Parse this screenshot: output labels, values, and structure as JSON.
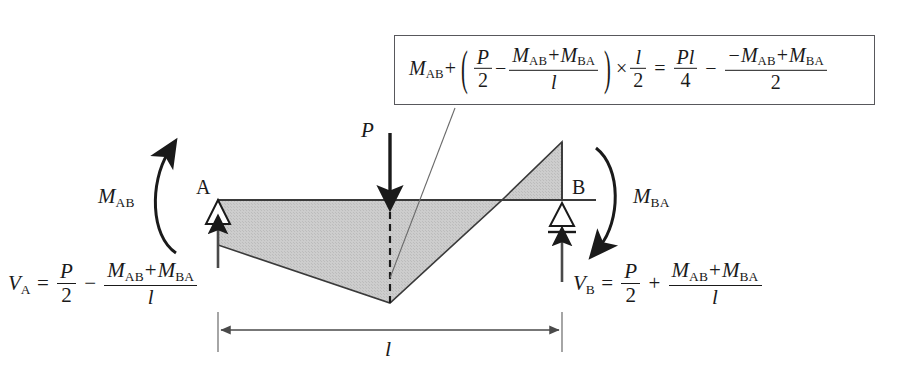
{
  "figure": {
    "background_color": "#ffffff",
    "diagram_fill_color": "#c9c9c9",
    "line_color": "#1a1a1a",
    "box_border_color": "#58585c"
  },
  "formula_box": {
    "name": "midspan-moment-equation",
    "lhs": {
      "term1": "M",
      "term1_sub": "AB",
      "plus": "+",
      "group": {
        "frac1": {
          "num": "P",
          "den": "2"
        },
        "minus": "−",
        "frac2": {
          "num": "Mₐʙ + Mʙₐ",
          "den": "l"
        }
      },
      "times": "×",
      "frac3": {
        "num": "l",
        "den": "2"
      }
    },
    "equals": "=",
    "rhs": {
      "frac1": {
        "num": "Pl",
        "den": "4"
      },
      "minus": "−",
      "frac2": {
        "num": "−Mₐʙ + Mʙₐ",
        "den": "2"
      }
    },
    "plain_text": "M_AB + (P/2 − (M_AB+M_BA)/l) × l/2 = Pl/4 − (−M_AB+M_BA)/2"
  },
  "labels": {
    "support_a": "A",
    "support_b": "B",
    "load": "P",
    "moment_ab": {
      "symbol": "M",
      "sub": "AB"
    },
    "moment_ba": {
      "symbol": "M",
      "sub": "BA"
    },
    "span": "l"
  },
  "reactions": {
    "left": {
      "name": "reaction-va",
      "symbol": "V",
      "sub": "A",
      "equals": "=",
      "frac1": {
        "num": "P",
        "den": "2"
      },
      "sign": "−",
      "frac2": {
        "num": "Mₐʙ + Mʙₐ",
        "den": "l"
      },
      "plain_text": "V_A = P/2 − (M_AB+M_BA)/l"
    },
    "right": {
      "name": "reaction-vb",
      "symbol": "V",
      "sub": "B",
      "equals": "=",
      "frac1": {
        "num": "P",
        "den": "2"
      },
      "sign": "+",
      "frac2": {
        "num": "Mₐʙ + Mʙₐ",
        "den": "l"
      },
      "plain_text": "V_B = P/2 + (M_AB+M_BA)/l"
    }
  },
  "geometry": {
    "beam_axis_y": 200,
    "support_a_x": 218,
    "support_b_x": 562,
    "midspan_x": 390,
    "negative_peak_y": 303,
    "positive_peak_y": 142,
    "zero_crossing_x": 502,
    "dimension_line_y": 330,
    "span_label": "l"
  }
}
